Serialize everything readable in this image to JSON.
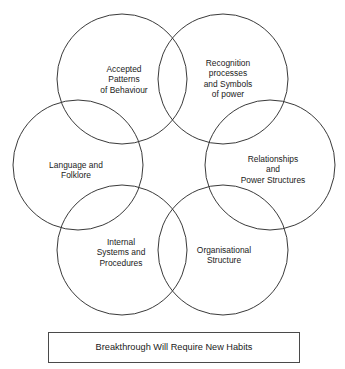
{
  "diagram": {
    "type": "venn-hexagon",
    "stroke_color": "#3a3a3a",
    "background_color": "#ffffff",
    "text_color": "#1a1a1a",
    "circles": [
      {
        "id": "accepted-patterns-of-behaviour",
        "label": "Accepted\nPatterns\nof Behaviour",
        "cx": 122,
        "cy": 79,
        "r": 65,
        "label_x": 124,
        "label_y": 80
      },
      {
        "id": "recognition-processes-and-symbols-of-power",
        "label": "Recognition\nprocesses\nand Symbols\nof power",
        "cx": 223,
        "cy": 79,
        "r": 65,
        "label_x": 228,
        "label_y": 79
      },
      {
        "id": "language-and-folklore",
        "label": "Language and\nFolklore",
        "cx": 78,
        "cy": 165,
        "r": 65,
        "label_x": 76,
        "label_y": 170
      },
      {
        "id": "relationships-and-power-structures",
        "label": "Relationships\nand\nPower Structures",
        "cx": 270,
        "cy": 165,
        "r": 65,
        "label_x": 273,
        "label_y": 170
      },
      {
        "id": "internal-systems-and-procedures",
        "label": "Internal\nSystems and\nProcedures",
        "cx": 122,
        "cy": 250,
        "r": 65,
        "label_x": 121,
        "label_y": 253
      },
      {
        "id": "organisational-structure",
        "label": "Organisational\nStructure",
        "cx": 223,
        "cy": 250,
        "r": 65,
        "label_x": 224,
        "label_y": 255
      }
    ]
  },
  "banner": {
    "text": "Breakthrough Will Require New Habits",
    "border_color": "#4a4a4a",
    "background_color": "#ffffff"
  }
}
